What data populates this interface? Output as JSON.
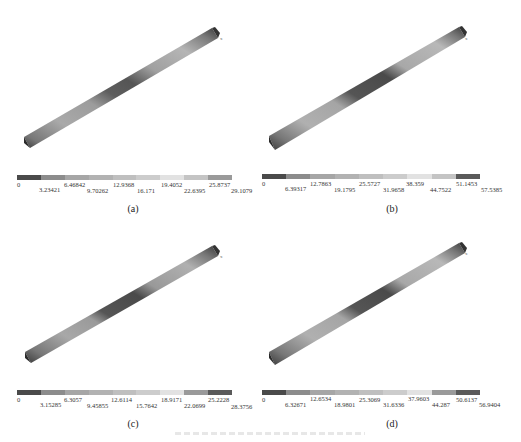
{
  "figure": {
    "caption_text": "",
    "panels": [
      {
        "id": "a",
        "label": "(a)",
        "axis_label": "x",
        "colorbar": {
          "ticks": [
            "0",
            "3.23421",
            "6.46842",
            "9.70262",
            "12.9368",
            "16.171",
            "19.4052",
            "22.6395",
            "25.8737",
            "29.1079"
          ],
          "colors": [
            "#4a4a4a",
            "#8c8c8c",
            "#a6a6a6",
            "#b2b2b2",
            "#bfbfbf",
            "#cccccc",
            "#e2e2e2",
            "#c4c4c4",
            "#9a9a9a",
            "#5a5a5a"
          ]
        }
      },
      {
        "id": "b",
        "label": "(b)",
        "axis_label": "x",
        "colorbar": {
          "ticks": [
            "0",
            "6.39317",
            "12.7863",
            "19.1795",
            "25.5727",
            "31.9658",
            "38.359",
            "44.7522",
            "51.1453",
            "57.5385"
          ],
          "colors": [
            "#4a4a4a",
            "#8c8c8c",
            "#a6a6a6",
            "#b2b2b2",
            "#bfbfbf",
            "#cccccc",
            "#e2e2e2",
            "#c4c4c4",
            "#9a9a9a",
            "#5a5a5a"
          ]
        }
      },
      {
        "id": "c",
        "label": "(c)",
        "axis_label": "x",
        "colorbar": {
          "ticks": [
            "0",
            "3.15285",
            "6.3057",
            "9.45855",
            "12.6114",
            "15.7642",
            "18.9171",
            "22.0699",
            "25.2228",
            "28.3756"
          ],
          "colors": [
            "#4a4a4a",
            "#8c8c8c",
            "#a6a6a6",
            "#b2b2b2",
            "#bfbfbf",
            "#cccccc",
            "#e2e2e2",
            "#c4c4c4",
            "#9a9a9a",
            "#5a5a5a"
          ]
        }
      },
      {
        "id": "d",
        "label": "(d)",
        "axis_label": "x",
        "colorbar": {
          "ticks": [
            "0",
            "6.32671",
            "12.6534",
            "18.9801",
            "25.3069",
            "31.6336",
            "37.9603",
            "44.287",
            "50.6137",
            "56.9404"
          ],
          "colors": [
            "#4a4a4a",
            "#8c8c8c",
            "#a6a6a6",
            "#b2b2b2",
            "#bfbfbf",
            "#cccccc",
            "#e2e2e2",
            "#c4c4c4",
            "#9a9a9a",
            "#5a5a5a"
          ]
        }
      }
    ]
  }
}
